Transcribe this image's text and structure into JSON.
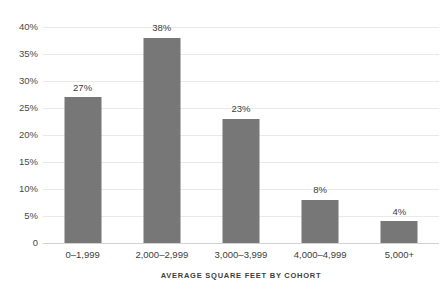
{
  "chart_data": {
    "type": "bar",
    "title": "",
    "subtitle": "",
    "xlabel": "AVERAGE SQUARE FEET BY COHORT",
    "ylabel": "",
    "categories": [
      "0–1,999",
      "2,000–2,999",
      "3,000–3,999",
      "4,000–4,999",
      "5,000+"
    ],
    "values": [
      27,
      38,
      23,
      8,
      4
    ],
    "value_labels": [
      "27%",
      "38%",
      "23%",
      "8%",
      "4%"
    ],
    "ylim": [
      0,
      40
    ],
    "yticks": [
      0,
      5,
      10,
      15,
      20,
      25,
      30,
      35,
      40
    ],
    "ytick_labels": [
      "0",
      "5%",
      "10%",
      "15%",
      "20%",
      "25%",
      "30%",
      "35%",
      "40%"
    ],
    "grid": true,
    "legend": false,
    "legend_position": "none",
    "colors": {
      "bar": "#777777",
      "gridline": "#e9e9e9",
      "baseline": "#d2d2d2",
      "text": "#3d3d3d",
      "background": "#ffffff"
    }
  }
}
